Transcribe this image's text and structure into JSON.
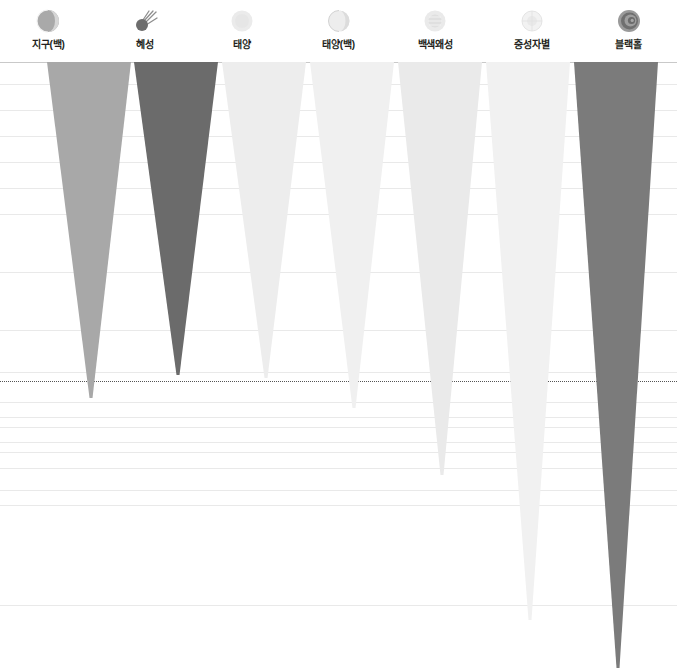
{
  "chart_data": {
    "type": "bar",
    "title": "",
    "subtitle": "",
    "xlabel": "",
    "ylabel": "",
    "grid": true,
    "legend_position": "top",
    "orientation": "downward-funnel",
    "categories": [
      "지구(백)",
      "혜성",
      "태양",
      "태양(백)",
      "백색왜성",
      "중성자별",
      "블랙홀"
    ],
    "series": [
      {
        "name": "depth",
        "values": [
          336,
          313,
          316,
          346,
          413,
          558,
          606
        ]
      }
    ],
    "axis_note": "values are funnel depths in pixels measured from plot top",
    "ylim": [
      0,
      606
    ]
  },
  "legend": {
    "items": [
      {
        "label": "지구(백)",
        "icon": "earth-icon",
        "color": "#a8a8a8",
        "icon_color": "#a9a9a9"
      },
      {
        "label": "혜성",
        "icon": "comet-icon",
        "color": "#6b6b6b",
        "icon_color": "#6d6d6d"
      },
      {
        "label": "태양",
        "icon": "sun-icon",
        "color": "#ededed",
        "icon_color": "#ebebeb"
      },
      {
        "label": "태양(백)",
        "icon": "sun-white-icon",
        "color": "#f0f0f0",
        "icon_color": "#e6e6e6"
      },
      {
        "label": "백색왜성",
        "icon": "white-dwarf-icon",
        "color": "#eaeaea",
        "icon_color": "#e4e4e4"
      },
      {
        "label": "중성자별",
        "icon": "neutron-star-icon",
        "color": "#f1f1f1",
        "icon_color": "#ededed"
      },
      {
        "label": "블랙홀",
        "icon": "black-hole-icon",
        "color": "#7b7b7b",
        "icon_color": "#6f6f6f"
      }
    ]
  },
  "plot": {
    "funnels": [
      {
        "name": "지구(백)",
        "left": 47,
        "top_width": 84,
        "depth": 336,
        "tip_offset": 44,
        "color": "#a8a8a8"
      },
      {
        "name": "혜성",
        "left": 134,
        "top_width": 84,
        "depth": 313,
        "tip_offset": 44,
        "color": "#6b6b6b"
      },
      {
        "name": "태양",
        "left": 222,
        "top_width": 84,
        "depth": 316,
        "tip_offset": 44,
        "color": "#ededed"
      },
      {
        "name": "태양(백)",
        "left": 310,
        "top_width": 84,
        "depth": 346,
        "tip_offset": 44,
        "color": "#f0f0f0"
      },
      {
        "name": "백색왜성",
        "left": 398,
        "top_width": 84,
        "depth": 413,
        "tip_offset": 44,
        "color": "#eaeaea"
      },
      {
        "name": "중성자별",
        "left": 486,
        "top_width": 84,
        "depth": 558,
        "tip_offset": 44,
        "color": "#f1f1f1"
      },
      {
        "name": "블랙홀",
        "left": 574,
        "top_width": 84,
        "depth": 606,
        "tip_offset": 44,
        "color": "#7b7b7b"
      }
    ],
    "gridlines_y": [
      0,
      22,
      48,
      74,
      100,
      126,
      152,
      210,
      268,
      310,
      340,
      355,
      365,
      380,
      390,
      406,
      428,
      443,
      543
    ],
    "top_rule_y": 0,
    "dotted_line_y": 319,
    "grid_color": "#e9e9e9",
    "dotted_color": "#555555",
    "background": "#ffffff"
  }
}
